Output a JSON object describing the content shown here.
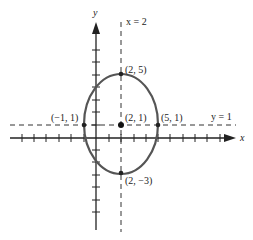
{
  "figure": {
    "type": "ellipse-graph",
    "axes": {
      "x_label": "x",
      "y_label": "y"
    },
    "guide_lines": {
      "vertical_label": "x = 2",
      "horizontal_label": "y = 1"
    },
    "points": {
      "top": "(2, 5)",
      "center": "(2, 1)",
      "left": "(−1, 1)",
      "right": "(5, 1)",
      "bottom": "(2, −3)"
    },
    "ellipse": {
      "center": [
        2,
        1
      ],
      "semi_axis_x": 3,
      "semi_axis_y": 4
    },
    "colors": {
      "ellipse": "#555555",
      "axes": "#222222",
      "dashed": "#333333"
    }
  }
}
